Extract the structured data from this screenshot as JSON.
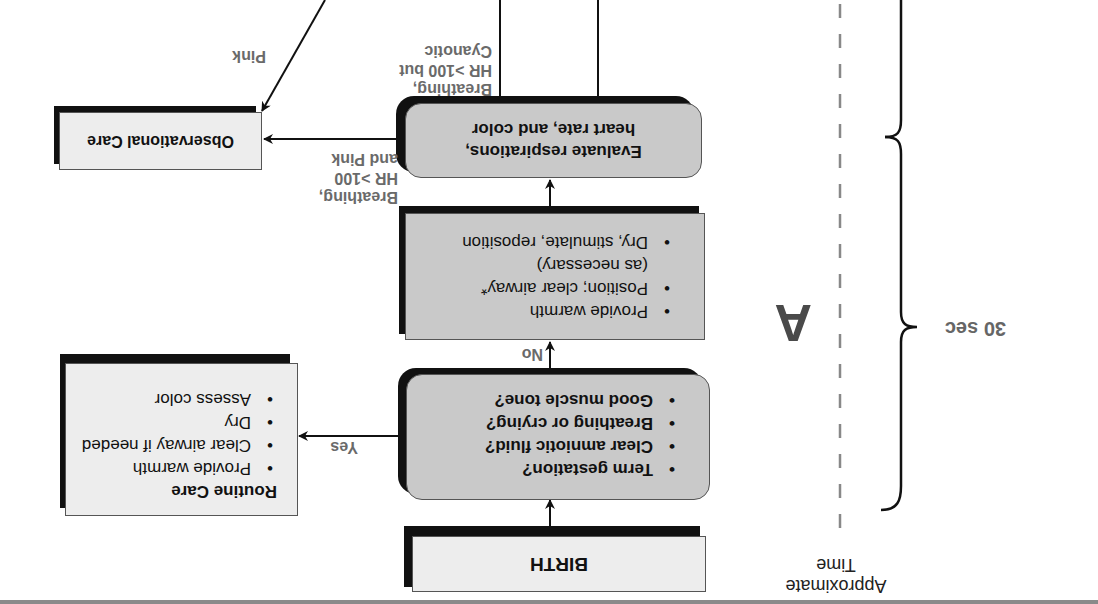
{
  "figure": {
    "orientation": "rotated 180 degrees",
    "panel_label": "A",
    "timeline": {
      "label_line1": "Approximate",
      "label_line2": "Time",
      "interval_label": "30 sec"
    },
    "nodes": {
      "birth": {
        "label": "BIRTH"
      },
      "assessment": {
        "items": [
          "Term gestation?",
          "Clear amniotic fluid?",
          "Breathing or crying?",
          "Good muscle tone?"
        ]
      },
      "initial_steps": {
        "items": [
          "Provide warmth",
          "Position; clear airway*",
          "(as necessary)",
          "Dry, stimulate, reposition"
        ]
      },
      "evaluate": {
        "line1": "Evaluate respirations,",
        "line2": "heart rate, and color"
      },
      "routine_care": {
        "title": "Routine Care",
        "items": [
          "Provide warmth",
          "Clear airway if needed",
          "Dry",
          "Assess color"
        ]
      },
      "observational_care": {
        "label": "Observational Care"
      }
    },
    "edges": {
      "yes": "Yes",
      "no": "No",
      "breathing_pink": {
        "line1": "Breathing,",
        "line2": "HR >100",
        "line3": "and Pink"
      },
      "breathing_cyanotic": {
        "line1": "Breathing,",
        "line2": "HR >100 but",
        "line3": "Cyanotic"
      },
      "pink": "Pink"
    },
    "colors": {
      "box_light": "#ededed",
      "box_gray": "#c9c9c9",
      "shadow": "#111111",
      "label_gray": "#6a6a6a",
      "dashed_line": "#888888"
    }
  }
}
